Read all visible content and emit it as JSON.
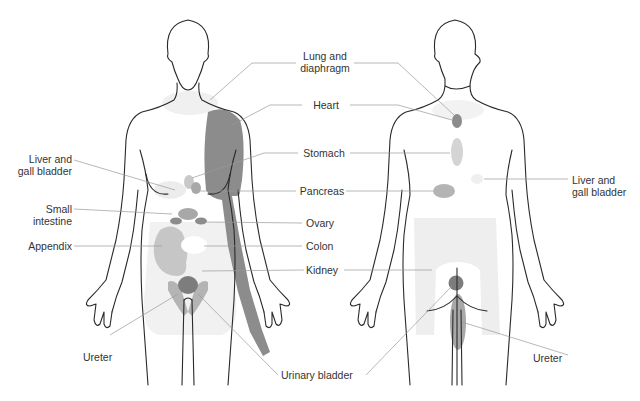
{
  "colors": {
    "outline": "#2a2a2a",
    "leader": "#9a9a9a",
    "label_text": "#333333",
    "heart_region": "#8c8c8c",
    "organ_dark": "#7d7d7d",
    "organ_mid": "#a8a8a8",
    "organ_light": "#c8c8c8",
    "organ_faint": "#e6e6e6",
    "organ_very_faint": "#f0f0f0"
  },
  "figures": {
    "front": {
      "view": "anterior"
    },
    "back": {
      "view": "posterior"
    }
  },
  "labels": {
    "lung_diaphragm": "Lung and\ndiaphragm",
    "lung_line1": "Lung and",
    "lung_line2": "diaphragm",
    "heart": "Heart",
    "stomach": "Stomach",
    "pancreas": "Pancreas",
    "ovary": "Ovary",
    "colon": "Colon",
    "kidney": "Kidney",
    "urinary_bladder": "Urinary bladder",
    "front_liver_line1": "Liver and",
    "front_liver_line2": "gall bladder",
    "small_intestine_line1": "Small",
    "small_intestine_line2": "intestine",
    "appendix": "Appendix",
    "front_ureter": "Ureter",
    "back_liver_line1": "Liver and",
    "back_liver_line2": "gall bladder",
    "back_ureter": "Ureter"
  }
}
